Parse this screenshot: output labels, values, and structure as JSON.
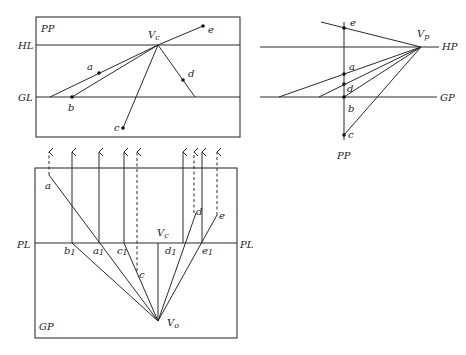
{
  "diagram": {
    "perspective_view": {
      "frame_label": "PP",
      "horizon_label": "HL",
      "ground_label": "GL",
      "vanishing_label": "V",
      "vanishing_sub": "c",
      "points": [
        "a",
        "b",
        "c",
        "d",
        "e"
      ]
    },
    "side_view": {
      "horizon_label": "HP",
      "ground_label": "GP",
      "picture_plane_label": "PP",
      "vanishing_label": "V",
      "vanishing_sub": "p",
      "points": [
        "e",
        "a",
        "d",
        "b",
        "c"
      ]
    },
    "plan_view": {
      "picture_line_label_left": "PL",
      "picture_line_label_right": "PL",
      "ground_label": "GP",
      "center_label": "V",
      "center_sub": "c",
      "station_label": "V",
      "station_sub": "o",
      "points": [
        "a",
        "d",
        "e",
        "c"
      ],
      "trace_labels": [
        {
          "name": "b",
          "sub": "1"
        },
        {
          "name": "a",
          "sub": "1"
        },
        {
          "name": "c",
          "sub": "1"
        },
        {
          "name": "d",
          "sub": "1"
        },
        {
          "name": "e",
          "sub": "1"
        }
      ]
    }
  }
}
